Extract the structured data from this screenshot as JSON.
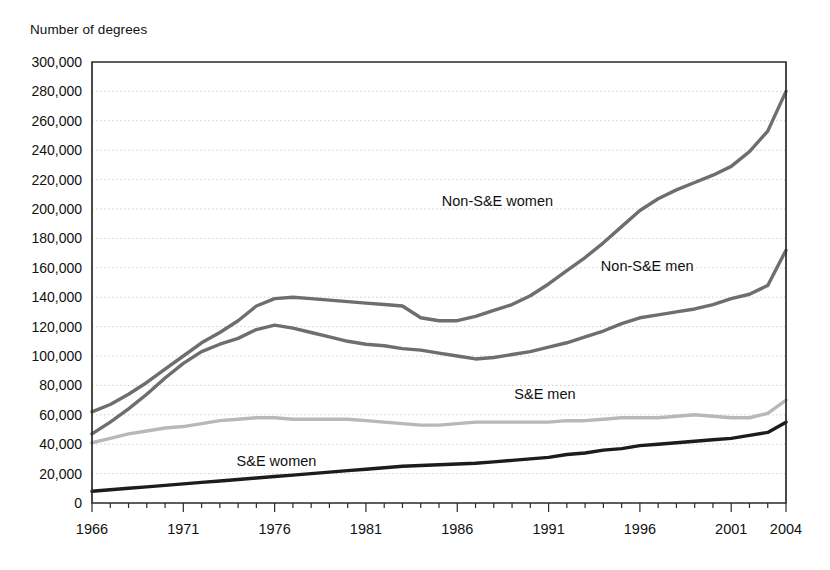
{
  "axis_title": "Number of degrees",
  "chart_data": {
    "type": "line",
    "title": "",
    "subtitle": "",
    "xlabel": "",
    "ylabel": "Number of degrees",
    "grid": true,
    "legend_position": "inline-annotations",
    "xlim": [
      1966,
      2004
    ],
    "ylim": [
      0,
      300000
    ],
    "ytick_labels": [
      "300,000",
      "280,000",
      "260,000",
      "240,000",
      "220,000",
      "200,000",
      "180,000",
      "160,000",
      "140,000",
      "120,000",
      "100,000",
      "80,000",
      "60,000",
      "40,000",
      "20,000",
      "0"
    ],
    "ytick_values": [
      300000,
      280000,
      260000,
      240000,
      220000,
      200000,
      180000,
      160000,
      140000,
      120000,
      100000,
      80000,
      60000,
      40000,
      20000,
      0
    ],
    "xtick_labels": [
      "1966",
      "1971",
      "1976",
      "1981",
      "1986",
      "1991",
      "1996",
      "2001",
      "2004"
    ],
    "xtick_values": [
      1966,
      1971,
      1976,
      1981,
      1986,
      1991,
      1996,
      2001,
      2004
    ],
    "x": [
      1966,
      1967,
      1968,
      1969,
      1970,
      1971,
      1972,
      1973,
      1974,
      1975,
      1976,
      1977,
      1978,
      1979,
      1980,
      1981,
      1982,
      1983,
      1984,
      1985,
      1986,
      1987,
      1988,
      1989,
      1990,
      1991,
      1992,
      1993,
      1994,
      1995,
      1996,
      1997,
      1998,
      1999,
      2000,
      2001,
      2002,
      2003,
      2004
    ],
    "series": [
      {
        "name": "Non-S&E women",
        "color": "#6e6e6e",
        "width": 3.4,
        "label_x": 1988.2,
        "label_y": 202000,
        "values": [
          62000,
          67000,
          74000,
          82000,
          91000,
          100000,
          109000,
          116000,
          124000,
          134000,
          139000,
          140000,
          139000,
          138000,
          137000,
          136000,
          135000,
          134000,
          126000,
          124000,
          124000,
          127000,
          131000,
          135000,
          141000,
          149000,
          158000,
          167000,
          177000,
          188000,
          199000,
          207000,
          213000,
          218000,
          223000,
          229000,
          239000,
          253000,
          280000
        ]
      },
      {
        "name": "Non-S&E men",
        "color": "#6e6e6e",
        "width": 3.4,
        "label_x": 1996.4,
        "label_y": 158000,
        "values": [
          47000,
          55000,
          64000,
          74000,
          85000,
          95000,
          103000,
          108000,
          112000,
          118000,
          121000,
          119000,
          116000,
          113000,
          110000,
          108000,
          107000,
          105000,
          104000,
          102000,
          100000,
          98000,
          99000,
          101000,
          103000,
          106000,
          109000,
          113000,
          117000,
          122000,
          126000,
          128000,
          130000,
          132000,
          135000,
          139000,
          142000,
          148000,
          172000
        ]
      },
      {
        "name": "S&E men",
        "color": "#b8b8b8",
        "width": 3.4,
        "label_x": 1990.8,
        "label_y": 71000,
        "values": [
          41000,
          44000,
          47000,
          49000,
          51000,
          52000,
          54000,
          56000,
          57000,
          58000,
          58000,
          57000,
          57000,
          57000,
          57000,
          56000,
          55000,
          54000,
          53000,
          53000,
          54000,
          55000,
          55000,
          55000,
          55000,
          55000,
          56000,
          56000,
          57000,
          58000,
          58000,
          58000,
          59000,
          60000,
          59000,
          58000,
          58000,
          61000,
          70000
        ]
      },
      {
        "name": "S&E women",
        "color": "#1c1c1c",
        "width": 3.4,
        "label_x": 1976.1,
        "label_y": 25500,
        "values": [
          8000,
          9000,
          10000,
          11000,
          12000,
          13000,
          14000,
          15000,
          16000,
          17000,
          18000,
          19000,
          20000,
          21000,
          22000,
          23000,
          24000,
          25000,
          25500,
          26000,
          26500,
          27000,
          28000,
          29000,
          30000,
          31000,
          33000,
          34000,
          36000,
          37000,
          39000,
          40000,
          41000,
          42000,
          43000,
          44000,
          46000,
          48000,
          55000
        ]
      }
    ]
  }
}
